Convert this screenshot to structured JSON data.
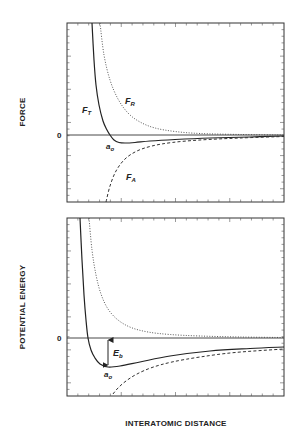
{
  "chart_data": [
    {
      "type": "line",
      "title": "",
      "xlabel": "",
      "ylabel": "FORCE",
      "y_tick_labels": [
        "0"
      ],
      "grid": false,
      "legend": "none (inline curve labels)",
      "frame": {
        "left": 67,
        "top": 23,
        "right": 284,
        "bottom": 202,
        "zero_y": 135
      },
      "series": [
        {
          "name": "F_T",
          "label": "F",
          "sub": "T",
          "style": "solid",
          "label_pos": [
            84,
            113
          ],
          "points": [
            [
              92,
              23
            ],
            [
              94,
              60
            ],
            [
              96,
              85
            ],
            [
              99,
              105
            ],
            [
              103,
              121
            ],
            [
              107,
              130
            ],
            [
              110,
              135
            ],
            [
              114,
              140
            ],
            [
              119,
              142.5
            ],
            [
              125,
              143
            ],
            [
              135,
              142.5
            ],
            [
              150,
              141
            ],
            [
              175,
              139.5
            ],
            [
              210,
              138
            ],
            [
              250,
              137
            ],
            [
              284,
              136
            ]
          ]
        },
        {
          "name": "F_R",
          "label": "F",
          "sub": "R",
          "style": "dotted",
          "label_pos": [
            127,
            104
          ],
          "points": [
            [
              100,
              23
            ],
            [
              104,
              55
            ],
            [
              110,
              80
            ],
            [
              118,
              99
            ],
            [
              128,
              113
            ],
            [
              140,
              122
            ],
            [
              155,
              128
            ],
            [
              175,
              131.5
            ],
            [
              200,
              133.5
            ],
            [
              240,
              134.5
            ],
            [
              284,
              135
            ]
          ]
        },
        {
          "name": "F_A",
          "label": "F",
          "sub": "A",
          "style": "dashed",
          "label_pos": [
            127,
            180
          ],
          "points": [
            [
              106,
              202
            ],
            [
              110,
              186
            ],
            [
              116,
              171
            ],
            [
              125,
              159
            ],
            [
              137,
              151
            ],
            [
              152,
              146
            ],
            [
              172,
              142.5
            ],
            [
              200,
              140
            ],
            [
              240,
              138
            ],
            [
              284,
              136.5
            ]
          ]
        }
      ],
      "annotations": [
        {
          "text": "a",
          "sub": "o",
          "pos": [
            107,
            149
          ]
        }
      ]
    },
    {
      "type": "line",
      "title": "",
      "xlabel": "INTERATOMIC DISTANCE",
      "ylabel": "POTENTIAL ENERGY",
      "y_tick_labels": [
        "0"
      ],
      "grid": false,
      "legend": "none",
      "frame": {
        "left": 67,
        "top": 218,
        "right": 284,
        "bottom": 396,
        "zero_y": 338
      },
      "series": [
        {
          "name": "E_net",
          "style": "solid",
          "points": [
            [
              80,
              218
            ],
            [
              82,
              260
            ],
            [
              84,
              295
            ],
            [
              86,
              320
            ],
            [
              88,
              338
            ],
            [
              91,
              350
            ],
            [
              95,
              358
            ],
            [
              100,
              364
            ],
            [
              108,
              367
            ],
            [
              120,
              366
            ],
            [
              140,
              362
            ],
            [
              170,
              356
            ],
            [
              210,
              351
            ],
            [
              250,
              348.5
            ],
            [
              284,
              347
            ]
          ]
        },
        {
          "name": "E_repulsive",
          "style": "dotted",
          "points": [
            [
              89,
              218
            ],
            [
              92,
              250
            ],
            [
              96,
              275
            ],
            [
              101,
              294
            ],
            [
              108,
              309
            ],
            [
              118,
              320
            ],
            [
              131,
              327.5
            ],
            [
              148,
              332
            ],
            [
              170,
              334.5
            ],
            [
              200,
              336
            ],
            [
              240,
              337
            ],
            [
              284,
              337.5
            ]
          ]
        },
        {
          "name": "E_attractive",
          "style": "dashed",
          "points": [
            [
              113,
              394
            ],
            [
              118,
              388
            ],
            [
              126,
              381
            ],
            [
              137,
              374
            ],
            [
              152,
              367.5
            ],
            [
              172,
              362
            ],
            [
              200,
              357
            ],
            [
              235,
              352.5
            ],
            [
              284,
              349
            ]
          ]
        }
      ],
      "annotations": [
        {
          "text": "E",
          "sub": "b",
          "pos": [
            113,
            355
          ],
          "arrow": {
            "x": 108,
            "y1": 339,
            "y2": 366
          }
        },
        {
          "text": "a",
          "sub": "o",
          "pos": [
            104,
            377
          ]
        }
      ]
    }
  ],
  "labels": {
    "top_ylabel": "FORCE",
    "bottom_ylabel": "POTENTIAL ENERGY",
    "xlabel": "INTERATOMIC DISTANCE",
    "zero": "0",
    "ft": "F",
    "ft_sub": "T",
    "fr": "F",
    "fr_sub": "R",
    "fa": "F",
    "fa_sub": "A",
    "a0": "a",
    "a0_sub": "o",
    "eb": "E",
    "eb_sub": "b"
  }
}
